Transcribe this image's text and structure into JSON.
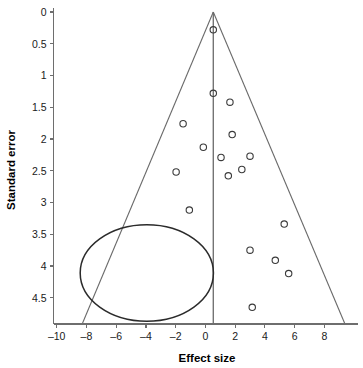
{
  "chart_data": {
    "type": "scatter",
    "title": "",
    "subtitle": "",
    "xlabel": "Effect size",
    "ylabel": "Standard error",
    "xlim": [
      -10.6,
      10.2
    ],
    "ylim": [
      0,
      4.92
    ],
    "y_inverted": true,
    "grid": false,
    "legend": null,
    "xticks": [
      -10,
      -8,
      -6,
      -4,
      -2,
      0,
      2,
      4,
      6,
      8
    ],
    "xticklabels": [
      "–10",
      "–8",
      "–6",
      "–4",
      "–2",
      "0",
      "2",
      "4",
      "6",
      "8"
    ],
    "yticks": [
      0,
      0.5,
      1,
      1.5,
      2,
      2.5,
      3,
      3.5,
      4,
      4.5
    ],
    "yticklabels": [
      "0",
      "0.5",
      "1",
      "1.5",
      "2",
      "2.5",
      "3",
      "3.5",
      "4",
      "4.5"
    ],
    "series": [
      {
        "name": "studies",
        "marker": "open-circle",
        "points": [
          {
            "x": 0.53,
            "y": 0.28
          },
          {
            "x": 0.53,
            "y": 1.28
          },
          {
            "x": 1.65,
            "y": 1.42
          },
          {
            "x": -1.5,
            "y": 1.76
          },
          {
            "x": 1.8,
            "y": 1.93
          },
          {
            "x": -0.14,
            "y": 2.13
          },
          {
            "x": 3.0,
            "y": 2.27
          },
          {
            "x": 1.05,
            "y": 2.29
          },
          {
            "x": 2.45,
            "y": 2.48
          },
          {
            "x": -1.97,
            "y": 2.52
          },
          {
            "x": 1.54,
            "y": 2.58
          },
          {
            "x": -1.08,
            "y": 3.12
          },
          {
            "x": 5.3,
            "y": 3.34
          },
          {
            "x": 3.0,
            "y": 3.75
          },
          {
            "x": 4.7,
            "y": 3.91
          },
          {
            "x": 5.6,
            "y": 4.12
          },
          {
            "x": 3.15,
            "y": 4.65
          }
        ]
      }
    ],
    "annotations": [
      {
        "name": "funnel-triangle",
        "type": "triangle",
        "apex": {
          "x": 0.53,
          "y": 0.0
        },
        "left_base": {
          "x": -8.3,
          "y": 4.92
        },
        "right_base": {
          "x": 9.4,
          "y": 4.92
        }
      },
      {
        "name": "center-reference-line",
        "type": "vline",
        "x": 0.53,
        "y_from": 0.0,
        "y_to": 4.92
      },
      {
        "name": "missing-studies-ellipse",
        "type": "ellipse",
        "center": {
          "x": -3.94,
          "y": 4.11
        },
        "rx": 4.48,
        "ry": 0.76
      }
    ]
  },
  "axis": {
    "x_title": "Effect size",
    "y_title": "Standard error"
  },
  "colors": {
    "axis": "#6e6e6e",
    "funnel": "#6a6a6a",
    "ellipse": "#2b2b2b",
    "marker": "#3a3a3a",
    "text": "#1a1a1a",
    "background": "#ffffff"
  }
}
